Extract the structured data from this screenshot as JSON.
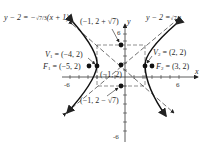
{
  "diagram": {
    "type": "hyperbola-graph",
    "axes": {
      "x_label": "x",
      "y_label": "y",
      "x_ticks": [
        "-6",
        "6"
      ],
      "y_ticks": [
        "6",
        "-6"
      ]
    },
    "asymptotes": {
      "left": {
        "label": "y − 2 = −",
        "frac": "√7/3",
        "tail": "(x + 1)"
      },
      "right": {
        "label": "y − 2 =",
        "frac": "√7/3"
      }
    },
    "points": {
      "top": "(−1, 2 + √7)",
      "center": "(−1, 2)",
      "bottom": "(−1, 2 − √7)",
      "v1": {
        "name": "V",
        "sub": "1",
        "value": "= (−4, 2)"
      },
      "f1": {
        "name": "F",
        "sub": "1",
        "value": "= (−5, 2)"
      },
      "v2": {
        "name": "V",
        "sub": "2",
        "value": "= (2, 2)"
      },
      "f2": {
        "name": "F",
        "sub": "2",
        "value": "= (3, 2)"
      }
    }
  }
}
